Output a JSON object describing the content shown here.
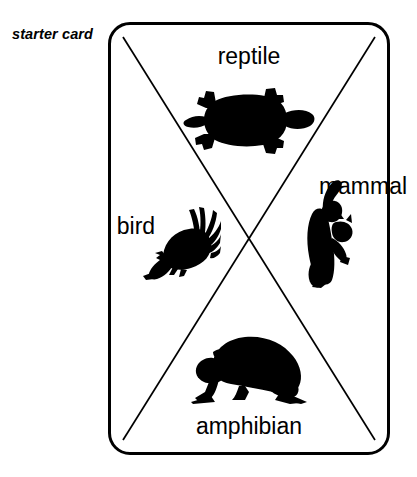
{
  "caption": {
    "text": "starter card"
  },
  "card": {
    "shape": "rounded-rectangle",
    "divider": "x-diagonals",
    "border_color": "#000000",
    "background_color": "#ffffff",
    "quadrants": [
      {
        "id": "reptile",
        "position": "top",
        "label": "reptile",
        "label_rotation_deg": 180,
        "icon_name": "turtle-silhouette",
        "icon_color": "#000000"
      },
      {
        "id": "mammal",
        "position": "right",
        "label": "mammal",
        "label_rotation_deg": -90,
        "icon_name": "cat-silhouette",
        "icon_color": "#000000"
      },
      {
        "id": "amphibian",
        "position": "bottom",
        "label": "amphibian",
        "label_rotation_deg": 0,
        "icon_name": "frog-silhouette",
        "icon_color": "#000000"
      },
      {
        "id": "bird",
        "position": "left",
        "label": "bird",
        "label_rotation_deg": 90,
        "icon_name": "rooster-silhouette",
        "icon_color": "#000000"
      }
    ]
  }
}
